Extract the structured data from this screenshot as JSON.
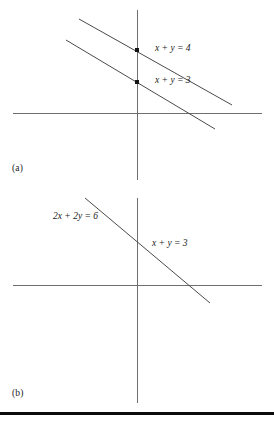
{
  "figure": {
    "background_color": "#ffffff",
    "line_color": "#4a4a4a",
    "axis_color": "#6f6f6f",
    "text_color": "#1a1a1a",
    "rule_color": "#0b0b0b"
  },
  "panels": [
    {
      "id": "a",
      "caption": "(a)",
      "description": "Two parallel lines that never intersect",
      "axes": {
        "x_axis": {
          "x1": 13,
          "y1": 113,
          "x2": 262,
          "y2": 113
        },
        "y_axis": {
          "x1": 137,
          "y1": 10,
          "x2": 137,
          "y2": 180
        }
      },
      "lines": [
        {
          "label": "x + y = 4",
          "label_x": 155,
          "label_y": 51,
          "x1": 79,
          "y1": 19,
          "x2": 232,
          "y2": 105
        },
        {
          "label": "x + y = 3",
          "label_x": 155,
          "label_y": 83,
          "x1": 66,
          "y1": 40,
          "x2": 215,
          "y2": 129
        }
      ],
      "points": [
        {
          "x": 137,
          "y": 50,
          "size": 4
        },
        {
          "x": 137,
          "y": 82,
          "size": 4
        }
      ]
    },
    {
      "id": "b",
      "caption": "(b)",
      "description": "A single line labeled with two equivalent equations",
      "axes": {
        "x_axis": {
          "x1": 13,
          "y1": 285,
          "x2": 262,
          "y2": 285
        },
        "y_axis": {
          "x1": 137,
          "y1": 198,
          "x2": 137,
          "y2": 403
        }
      },
      "lines": [
        {
          "label_left": "2x + 2y = 6",
          "label_left_x": 53,
          "label_left_y": 219,
          "label_right": "x + y = 3",
          "label_right_x": 152,
          "label_right_y": 246,
          "x1": 85,
          "y1": 198,
          "x2": 210,
          "y2": 303
        }
      ]
    }
  ],
  "bottom_rule": {
    "present": true,
    "y": 412,
    "height": 3
  }
}
